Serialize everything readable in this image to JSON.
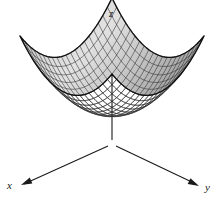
{
  "figure": {
    "kind": "3d-surface-plot",
    "title": "",
    "background_color": "#ffffff",
    "width": 224,
    "height": 202
  },
  "axes": {
    "z": {
      "label": "z",
      "icon": "arrow-up-icon",
      "direction": "up",
      "line": {
        "x1": 112,
        "y1": 16,
        "x2": 112,
        "y2": 140
      },
      "arrow_tip": {
        "x": 112,
        "y": 14
      },
      "label_pos": {
        "x": 109,
        "y": 8
      },
      "color": "#1a1a1a"
    },
    "x": {
      "label": "x",
      "icon": "arrow-down-left-icon",
      "direction": "down-left",
      "line": {
        "x1": 108,
        "y1": 146,
        "x2": 24,
        "y2": 184
      },
      "arrow_tip": {
        "x": 21,
        "y": 185
      },
      "label_pos": {
        "x": 7,
        "y": 180
      },
      "color": "#1a1a1a"
    },
    "y": {
      "label": "y",
      "icon": "arrow-down-right-icon",
      "direction": "down-right",
      "line": {
        "x1": 116,
        "y1": 146,
        "x2": 196,
        "y2": 184
      },
      "arrow_tip": {
        "x": 199,
        "y": 186
      },
      "label_pos": {
        "x": 205,
        "y": 182
      },
      "color": "#1a1a1a"
    }
  },
  "chart_data": {
    "type": "surface",
    "title": "",
    "xlabel": "x",
    "ylabel": "y",
    "zlabel": "z",
    "equation": "z = x^2 + y^2",
    "surface_name": "circular-paraboloid",
    "grid": true,
    "legend": false,
    "mesh": {
      "u_divisions": 20,
      "v_divisions": 20,
      "line_color": "#2b2b2b",
      "line_width": 0.55,
      "fill_light": "#e3e3e3",
      "fill_dark": "#9a9a9a",
      "outline_color": "#111111",
      "outline_width": 1.3
    },
    "projection": {
      "type": "oblique-axonometric",
      "center": {
        "x": 112,
        "y": 112
      },
      "x_axis_screen": {
        "dx": -4.6,
        "dy": 2.0
      },
      "y_axis_screen": {
        "dx": 4.6,
        "dy": 2.0
      },
      "z_axis_screen": {
        "dx": 0,
        "dy": -5.2
      },
      "z_scale": 0.52
    },
    "domain": {
      "u": [
        -1,
        1
      ],
      "v": [
        -1,
        1
      ]
    },
    "vertex_bottom": {
      "x": 112,
      "y": 150
    },
    "tips": [
      {
        "corner": "left",
        "x": 14,
        "y": 88
      },
      {
        "corner": "back",
        "x": 112,
        "y": 45
      },
      {
        "corner": "right",
        "x": 210,
        "y": 88
      },
      {
        "corner": "front",
        "x": 112,
        "y": 132
      }
    ]
  }
}
